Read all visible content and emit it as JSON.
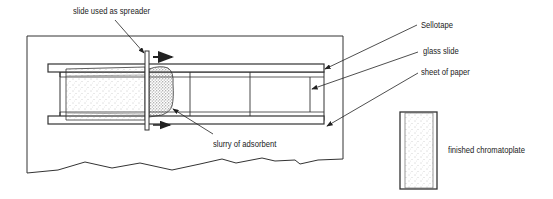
{
  "diagram": {
    "labels": {
      "spreader": "slide used as spreader",
      "sellotape": "Sellotape",
      "glass_slide": "glass slide",
      "paper": "sheet of paper",
      "slurry": "slurry of adsorbent",
      "finished": "finished chromatoplate"
    },
    "colors": {
      "line": "#333333",
      "background": "#ffffff",
      "stipple": "#777777"
    }
  }
}
